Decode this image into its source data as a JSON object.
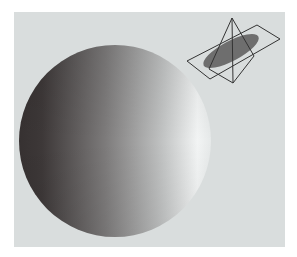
{
  "figure": {
    "background_color": "#d9dddd",
    "sphere": {
      "cx": 115,
      "cy": 141,
      "r": 96,
      "gradient_dark": "#363131",
      "gradient_mid": "#8a8888",
      "gradient_light": "#f2f4f4"
    },
    "inset": {
      "ellipse": {
        "cx": 231,
        "cy": 51,
        "rx": 31,
        "ry": 10,
        "angle": -28,
        "color": "#6e6e6e"
      },
      "plane": {
        "points": "187,61 257,25 280,39 210,79",
        "stroke": "#333333"
      },
      "tetrahedron": {
        "top": [
          232,
          18
        ],
        "bottom": [
          233,
          83
        ],
        "left": [
          209,
          69
        ],
        "right": [
          254,
          56
        ],
        "stroke": "#333333"
      }
    }
  }
}
